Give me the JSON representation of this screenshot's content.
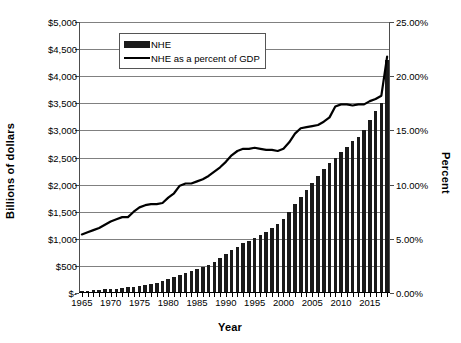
{
  "chart_data": {
    "type": "bar",
    "title": "",
    "xlabel": "Year",
    "ylabel": "Billions of dollars",
    "y2label": "Percent",
    "xlim": [
      1964.5,
      2018.5
    ],
    "ylim": [
      0,
      5000
    ],
    "y2lim": [
      0,
      25
    ],
    "grid": true,
    "legend_position": "upper-left-inside",
    "x_tick_labels": [
      "1965",
      "1970",
      "1975",
      "1980",
      "1985",
      "1990",
      "1995",
      "2000",
      "2005",
      "2010",
      "2015"
    ],
    "x_ticks": [
      1965,
      1970,
      1975,
      1980,
      1985,
      1990,
      1995,
      2000,
      2005,
      2010,
      2015
    ],
    "y_tick_labels": [
      "$-",
      "$500",
      "$1,000",
      "$1,500",
      "$2,000",
      "$2,500",
      "$3,000",
      "$3,500",
      "$4,000",
      "$4,500",
      "$5,000"
    ],
    "y_ticks": [
      0,
      500,
      1000,
      1500,
      2000,
      2500,
      3000,
      3500,
      4000,
      4500,
      5000
    ],
    "y2_tick_labels": [
      "0.00%",
      "5.00%",
      "10.00%",
      "15.00%",
      "20.00%",
      "25.00%"
    ],
    "y2_ticks": [
      0,
      5,
      10,
      15,
      20,
      25
    ],
    "categories": [
      1965,
      1966,
      1967,
      1968,
      1969,
      1970,
      1971,
      1972,
      1973,
      1974,
      1975,
      1976,
      1977,
      1978,
      1979,
      1980,
      1981,
      1982,
      1983,
      1984,
      1985,
      1986,
      1987,
      1988,
      1989,
      1990,
      1991,
      1992,
      1993,
      1994,
      1995,
      1996,
      1997,
      1998,
      1999,
      2000,
      2001,
      2002,
      2003,
      2004,
      2005,
      2006,
      2007,
      2008,
      2009,
      2010,
      2011,
      2012,
      2013,
      2014,
      2015,
      2016,
      2017,
      2018
    ],
    "series": [
      {
        "name": "NHE",
        "type": "bar",
        "axis": "left",
        "unit": "Billions of dollars",
        "color": "#1a1a1a",
        "values": [
          42,
          46,
          52,
          58,
          66,
          75,
          83,
          93,
          103,
          117,
          133,
          152,
          173,
          194,
          219,
          255,
          295,
          331,
          365,
          399,
          438,
          472,
          514,
          574,
          639,
          721,
          788,
          854,
          915,
          962,
          1016,
          1069,
          1125,
          1191,
          1265,
          1369,
          1495,
          1638,
          1772,
          1895,
          2024,
          2156,
          2296,
          2400,
          2496,
          2596,
          2690,
          2800,
          2880,
          3000,
          3200,
          3350,
          3500,
          4300
        ]
      },
      {
        "name": "NHE as a percent of GDP",
        "type": "line",
        "axis": "right",
        "unit": "Percent",
        "color": "#000000",
        "values": [
          5.4,
          5.6,
          5.8,
          6.0,
          6.3,
          6.6,
          6.8,
          7.0,
          7.0,
          7.5,
          7.9,
          8.1,
          8.2,
          8.2,
          8.3,
          8.8,
          9.2,
          9.9,
          10.1,
          10.1,
          10.3,
          10.5,
          10.8,
          11.2,
          11.6,
          12.1,
          12.7,
          13.1,
          13.3,
          13.3,
          13.4,
          13.3,
          13.2,
          13.2,
          13.1,
          13.3,
          13.9,
          14.7,
          15.2,
          15.3,
          15.4,
          15.5,
          15.8,
          16.2,
          17.2,
          17.4,
          17.4,
          17.3,
          17.4,
          17.4,
          17.7,
          17.9,
          18.2,
          21.8
        ]
      }
    ]
  },
  "legend": {
    "items": [
      {
        "label": "NHE",
        "marker": "bar-swatch"
      },
      {
        "label": "NHE as a percent of GDP",
        "marker": "line-swatch"
      }
    ]
  },
  "axes": {
    "left_title": "Billions of dollars",
    "right_title": "Percent",
    "x_title": "Year"
  }
}
